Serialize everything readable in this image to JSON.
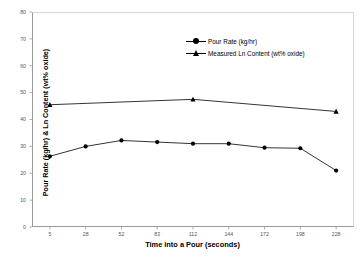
{
  "chart_data": {
    "type": "line",
    "title": "",
    "xlabel": "Time into a Pour (seconds)",
    "ylabel": "Pour Rate (kg/hr) & Ln Content (wt% oxide)",
    "categories": [
      "5",
      "28",
      "52",
      "83",
      "112",
      "144",
      "172",
      "198",
      "228"
    ],
    "xtick_labels": [
      "5",
      "28",
      "52",
      "83",
      "112",
      "144",
      "172",
      "198",
      "228"
    ],
    "ytick_labels": [
      "0",
      "10",
      "20",
      "30",
      "40",
      "50",
      "60",
      "70",
      "80"
    ],
    "ylim": [
      0,
      80
    ],
    "ytick_step": 10,
    "grid": false,
    "legend_position": "upper-center-right",
    "series": [
      {
        "name": "Pour Rate (kg/hr)",
        "marker": "circle",
        "color": "#000000",
        "x": [
          "5",
          "28",
          "52",
          "83",
          "112",
          "144",
          "172",
          "198",
          "228"
        ],
        "values": [
          26.3,
          30.0,
          32.2,
          31.6,
          31.0,
          31.0,
          29.5,
          29.3,
          21.0
        ]
      },
      {
        "name": "Measured Ln Content (wt% oxide)",
        "marker": "triangle",
        "color": "#000000",
        "x": [
          "5",
          "112",
          "228"
        ],
        "values": [
          45.5,
          47.5,
          43.0
        ]
      }
    ]
  },
  "legend": {
    "items": [
      {
        "label": "Pour Rate (kg/hr)",
        "marker": "circle-marker-icon"
      },
      {
        "label": "Measured Ln Content (wt% oxide)",
        "marker": "triangle-marker-icon"
      }
    ]
  },
  "axes": {
    "x_title": "Time into a Pour (seconds)",
    "y_title": "Pour Rate (kg/hr) & Ln Content (wt% oxide)"
  }
}
